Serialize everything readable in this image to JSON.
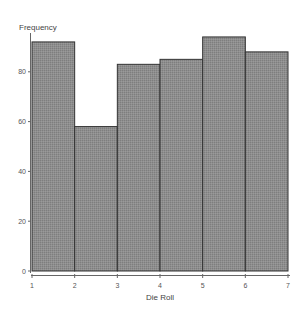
{
  "chart_data": {
    "type": "bar",
    "title": "",
    "xlabel": "Die Roll",
    "ylabel": "Frequency",
    "bins": [
      {
        "from": 1,
        "to": 2,
        "value": 92
      },
      {
        "from": 2,
        "to": 3,
        "value": 58
      },
      {
        "from": 3,
        "to": 4,
        "value": 83
      },
      {
        "from": 4,
        "to": 5,
        "value": 85
      },
      {
        "from": 5,
        "to": 6,
        "value": 94
      },
      {
        "from": 6,
        "to": 7,
        "value": 88
      }
    ],
    "categories": [
      "1-2",
      "2-3",
      "3-4",
      "4-5",
      "5-6",
      "6-7"
    ],
    "values": [
      92,
      58,
      83,
      85,
      94,
      88
    ],
    "x_ticks": [
      "1",
      "2",
      "3",
      "4",
      "5",
      "6",
      "7"
    ],
    "y_ticks": [
      "0",
      "20",
      "40",
      "60",
      "80"
    ],
    "xlim": [
      1,
      7
    ],
    "ylim": [
      0,
      96
    ],
    "grid": false,
    "legend": null,
    "colors": {
      "bar_fill": "#8c8c8c",
      "bar_stroke": "#333333",
      "axis": "#666666"
    }
  }
}
